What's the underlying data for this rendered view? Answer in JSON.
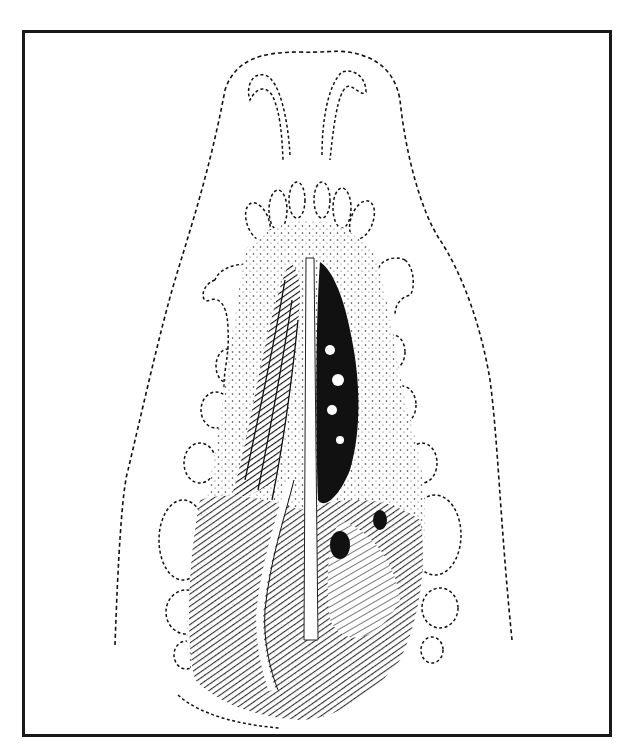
{
  "figure": {
    "description": "Anatomical line-and-stipple illustration, ventral view of a skull/palate with dashed outline",
    "frame_color": "#1a1a1a",
    "ink_color": "#111111",
    "background": "#ffffff"
  }
}
